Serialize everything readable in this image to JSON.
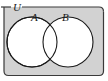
{
  "figure": {
    "name": "venn-diagram-two-sets-overlapping",
    "type": "venn",
    "caption": "",
    "universe": {
      "label": "U",
      "shape": "rounded-rectangle",
      "fill_color": "#d2d2d2",
      "stroke_color": "#3a3a3a",
      "label_position": "top-left-on-border"
    },
    "sets": [
      {
        "label": "A",
        "shape": "circle",
        "fill_color": "#ffffff",
        "stroke_color": "#1a1a1a",
        "center_x": 32,
        "center_y": 42,
        "radius": 25,
        "label_x": 33,
        "label_y": 20
      },
      {
        "label": "B",
        "shape": "circle",
        "fill_color": "#ffffff",
        "stroke_color": "#1a1a1a",
        "center_x": 68,
        "center_y": 42,
        "radius": 25,
        "label_x": 64,
        "label_y": 20
      }
    ],
    "regions": [
      {
        "name": "A-only",
        "fill": "#ffffff",
        "shaded": false
      },
      {
        "name": "A-intersect-B",
        "fill": "#ffffff",
        "shaded": false
      },
      {
        "name": "B-only",
        "fill": "#ffffff",
        "shaded": false
      },
      {
        "name": "outside-A-and-B",
        "fill": "#d2d2d2",
        "shaded": true
      }
    ],
    "colors": {
      "background": "#ffffff",
      "universe_fill": "#d2d2d2",
      "universe_stroke": "#3a3a3a",
      "circle_fill": "#ffffff",
      "circle_stroke": "#1a1a1a",
      "label": "#1a1a1a"
    }
  }
}
